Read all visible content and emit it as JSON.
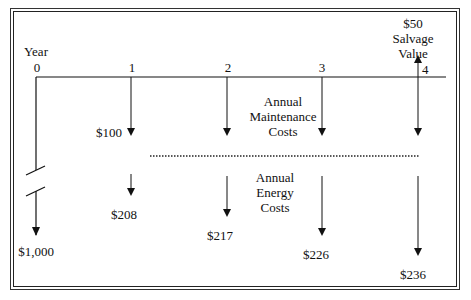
{
  "diagram": {
    "type": "cash-flow-diagram",
    "axis_label": "Year",
    "years": [
      "0",
      "1",
      "2",
      "3",
      "4"
    ],
    "salvage": {
      "amount": "$50",
      "label_line1": "Salvage",
      "label_line2": "Value",
      "year": "4",
      "direction": "up"
    },
    "initial_cost": {
      "amount": "$1,000",
      "year": "0",
      "direction": "down",
      "broken_scale": true
    },
    "maintenance": {
      "label_line1": "Annual",
      "label_line2": "Maintenance",
      "label_line3": "Costs",
      "amount_year1": "$100",
      "years": [
        "1",
        "2",
        "3",
        "4"
      ]
    },
    "energy": {
      "label_line1": "Annual",
      "label_line2": "Energy",
      "label_line3": "Costs",
      "amounts": [
        "$208",
        "$217",
        "$226",
        "$236"
      ],
      "years": [
        "1",
        "2",
        "3",
        "4"
      ]
    },
    "colors": {
      "line": "#111111",
      "background": "#ffffff",
      "frame": "#222222"
    }
  }
}
